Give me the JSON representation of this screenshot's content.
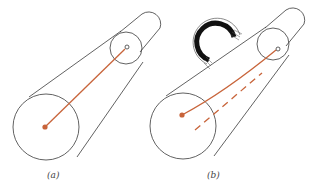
{
  "figure": {
    "panels": [
      {
        "id": "a",
        "label": "(a)",
        "description": "Truncated cone (shaft) with straight red line from base center to small end center"
      },
      {
        "id": "b",
        "label": "(b)",
        "description": "Same shaft under applied torque; red line twisted into a curve, dashed line shows original position"
      }
    ],
    "colors": {
      "outline": "#3a3a3a",
      "line": "#c8643a",
      "torque": "#111111",
      "background": "#ffffff"
    },
    "icons": {
      "torque_arrow": "curved-torque-arrow-icon"
    }
  }
}
